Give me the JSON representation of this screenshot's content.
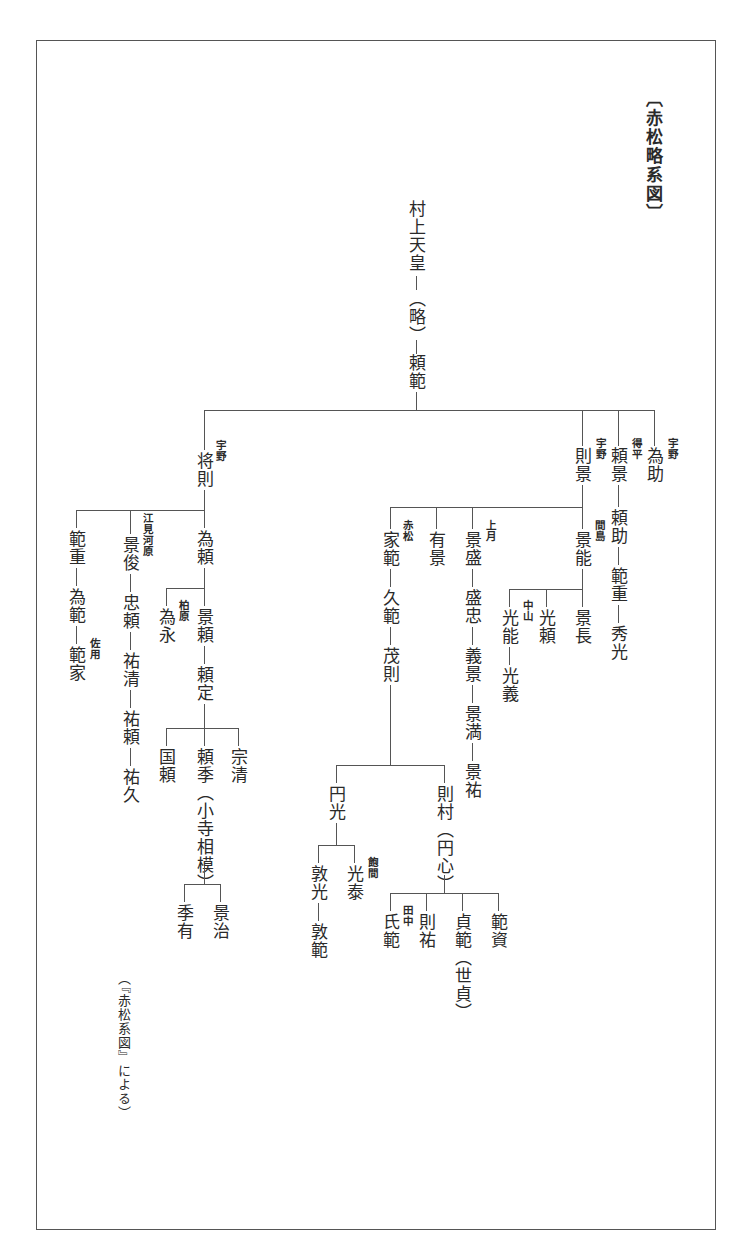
{
  "title": "〔赤松略系図〕",
  "source_note": "（『赤松系図』による）",
  "root": {
    "name": "村上天皇",
    "omitted": "（略）",
    "child": "頼範"
  },
  "branches": {
    "shonori": {
      "name": "将則",
      "label": "宇野"
    },
    "norikage": {
      "name": "則景",
      "label": "宇野"
    },
    "yorikage": {
      "name": "頼景",
      "label": "得平"
    },
    "tamesuke": {
      "name": "為助",
      "label": "宇野"
    }
  },
  "shonori_line": {
    "norishige": "範重",
    "tamenori": "為範",
    "noriie": "範家",
    "noriie_label": "佐用",
    "kagetoshi": "景俊",
    "kagetoshi_label": "江見河原",
    "tadayori": "忠頼",
    "sukekiyo": "祐清",
    "sukeyori": "祐頼",
    "sukehisa": "祐久",
    "tameyori": "為頼",
    "tamenaga": "為永",
    "tamenaga_label": "柏原",
    "kageyori": "景頼",
    "yorisada": "頼定",
    "kuniyori": "国頼",
    "yorisue": "頼季（小寺相模）",
    "munekiyo": "宗清",
    "suearu": "季有",
    "kageharu": "景治"
  },
  "norikage_line": {
    "ienori": "家範",
    "ienori_label": "赤松",
    "hisanori": "久範",
    "shigenori": "茂則",
    "enko": "円光",
    "atsumitsu": "敦光",
    "atsunori": "敦範",
    "mitsuyasu": "光泰",
    "mitsuyasu_label": "飽間",
    "norimura": "則村（円心）",
    "ujinori": "氏範",
    "ujinori_label": "田中",
    "norisuke": "則祐",
    "sadanori": "貞範（世貞）",
    "norisuke2": "範資",
    "arikage": "有景",
    "kagemori": "景盛",
    "kagemori_label": "上月",
    "moritada": "盛忠",
    "yoshikage": "義景",
    "kagemitsu": "景満",
    "kagesuke": "景祐",
    "kageyoshi": "景能",
    "kageyoshi_label": "間島",
    "mitsuyoshi": "光能",
    "mitsuyoshi_label": "中山",
    "mitsuyoshi2": "光義",
    "mitsuyori": "光頼",
    "kagenaga": "景長"
  },
  "yorikage_line": {
    "yorisuke": "頼助",
    "norishige": "範重",
    "hidemitsu": "秀光"
  }
}
